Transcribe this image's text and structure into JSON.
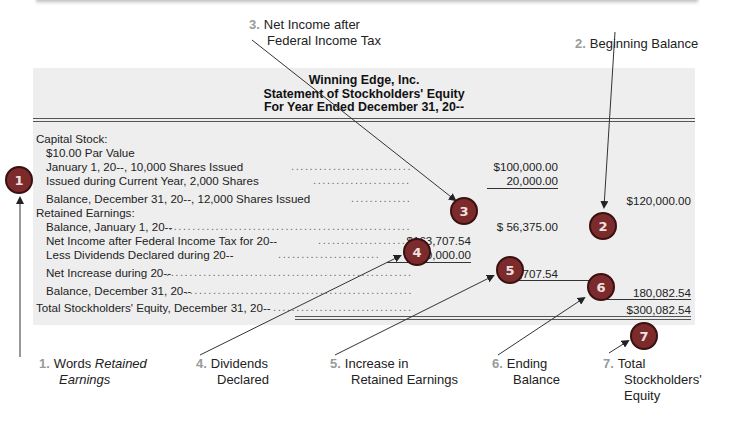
{
  "statement": {
    "company": "Winning Edge, Inc.",
    "title": "Statement of Stockholders' Equity",
    "period": "For Year Ended December 31, 20--",
    "rows": [
      {
        "label": "Capital Stock:",
        "indent": 0
      },
      {
        "label": "$10.00 Par Value",
        "indent": 1
      },
      {
        "label": "January 1, 20--, 10,000 Shares Issued",
        "indent": 1,
        "col2": "$100,000.00"
      },
      {
        "label": "Issued during Current Year, 2,000 Shares",
        "indent": 1,
        "col2": "20,000.00"
      },
      {
        "label": "Balance, December 31, 20--, 12,000 Shares Issued",
        "indent": 1,
        "col3": "$120,000.00"
      },
      {
        "label": "Retained Earnings:",
        "indent": 0
      },
      {
        "label": "Balance, January 1, 20--",
        "indent": 1,
        "col2": "$  56,375.00"
      },
      {
        "label": "Net Income after Federal Income Tax for 20--",
        "indent": 1,
        "col1": "$163,707.54"
      },
      {
        "label": "Less Dividends Declared during 20--",
        "indent": 1,
        "col1": "40,000.00"
      },
      {
        "label": "Net Increase during 20--",
        "indent": 1,
        "col2": "123,707.54"
      },
      {
        "label": "Balance, December 31, 20--",
        "indent": 1,
        "col3": "180,082.54"
      },
      {
        "label": "Total Stockholders' Equity, December 31, 20--",
        "indent": 0,
        "col3": "$300,082.54"
      }
    ]
  },
  "badges": [
    "1",
    "2",
    "3",
    "4",
    "5",
    "6",
    "7"
  ],
  "callouts": [
    {
      "num": "1.",
      "line1": "Words ",
      "line1_italic": "Retained",
      "line2_italic": "Earnings"
    },
    {
      "num": "2.",
      "line1": "Beginning Balance"
    },
    {
      "num": "3.",
      "line1": "Net Income after",
      "line2": "Federal Income Tax"
    },
    {
      "num": "4.",
      "line1": "Dividends",
      "line2": "Declared"
    },
    {
      "num": "5.",
      "line1": "Increase in",
      "line2": "Retained Earnings"
    },
    {
      "num": "6.",
      "line1": "Ending",
      "line2": "Balance"
    },
    {
      "num": "7.",
      "line1": "Total",
      "line2": "Stockholders'",
      "line3": "Equity"
    }
  ],
  "colors": {
    "badge_fill": "#7b2b2b",
    "panel_bg": "#eeeeee",
    "callout_number": "#9a9a9a"
  }
}
